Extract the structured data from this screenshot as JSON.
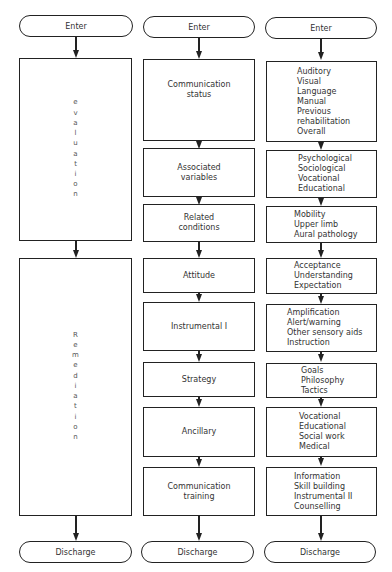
{
  "columns": [
    {
      "enter": "Enter",
      "discharge": "Discharge",
      "phases": [
        {
          "label": "evaluation",
          "letters": [
            "e",
            "v",
            "a",
            "l",
            "u",
            "a",
            "t",
            "i",
            "o",
            "n"
          ]
        },
        {
          "label": "Remediation",
          "letters": [
            "R",
            "e",
            "m",
            "e",
            "d",
            "i",
            "a",
            "t",
            "i",
            "o",
            "n"
          ]
        }
      ]
    },
    {
      "enter": "Enter",
      "discharge": "Discharge",
      "boxes": [
        {
          "lines": [
            "Communication",
            "status"
          ]
        },
        {
          "lines": [
            "Associated",
            "variables"
          ]
        },
        {
          "lines": [
            "Related",
            "conditions"
          ]
        },
        {
          "lines": [
            "Attitude"
          ]
        },
        {
          "lines": [
            "Instrumental I"
          ]
        },
        {
          "lines": [
            "Strategy"
          ]
        },
        {
          "lines": [
            "Ancillary"
          ]
        },
        {
          "lines": [
            "Communication",
            "training"
          ]
        }
      ]
    },
    {
      "enter": "Enter",
      "discharge": "Discharge",
      "boxes": [
        {
          "lines": [
            "Auditory",
            "Visual",
            "Language",
            "Manual",
            "Previous",
            "rehabilitation",
            "Overall"
          ]
        },
        {
          "lines": [
            "Psychological",
            "Sociological",
            "Vocational",
            "Educational"
          ]
        },
        {
          "lines": [
            "Mobility",
            "Upper limb",
            "Aural pathology"
          ]
        },
        {
          "lines": [
            "Acceptance",
            "Understanding",
            "Expectation"
          ]
        },
        {
          "lines": [
            "Amplification",
            "Alert/warning",
            "Other sensory aids",
            "Instruction"
          ]
        },
        {
          "lines": [
            "Goals",
            "Philosophy",
            "Tactics"
          ]
        },
        {
          "lines": [
            "Vocational",
            "Educational",
            "Social work",
            "Medical"
          ]
        },
        {
          "lines": [
            "Information",
            "Skill building",
            "Instrumental II",
            "Counselling"
          ]
        }
      ]
    }
  ]
}
